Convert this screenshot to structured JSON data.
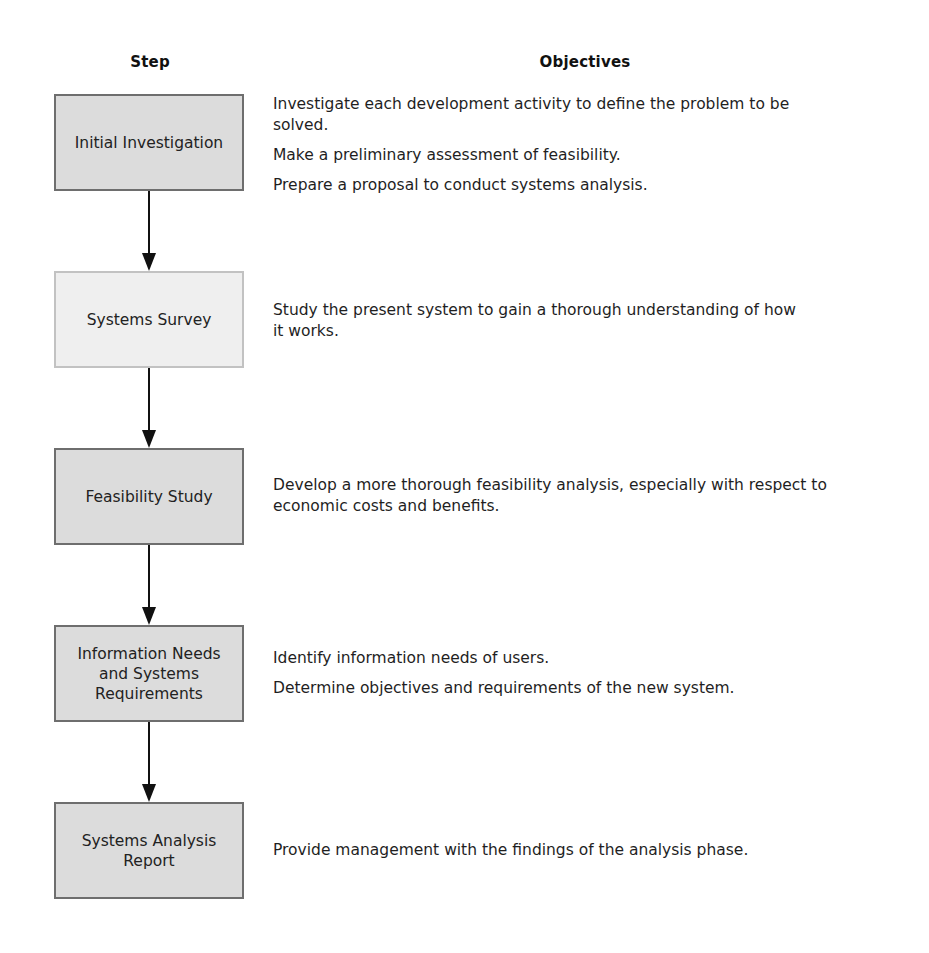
{
  "headers": {
    "step": "Step",
    "objectives": "Objectives"
  },
  "steps": [
    {
      "label": "Initial Investigation",
      "objectives": [
        "Investigate each development activity to define the problem to be solved.",
        "Make a preliminary assessment of feasibility.",
        "Prepare a proposal to conduct systems analysis."
      ]
    },
    {
      "label": "Systems Survey",
      "objectives": [
        "Study the present system to gain a thorough understanding of how it works."
      ]
    },
    {
      "label": "Feasibility Study",
      "objectives": [
        "Develop a more thorough feasibility analysis, especially with respect to economic costs and benefits."
      ]
    },
    {
      "label": "Information Needs and Systems Requirements",
      "objectives": [
        "Identify information needs of users.",
        "Determine objectives and requirements of the new system."
      ]
    },
    {
      "label": "Systems Analysis Report",
      "objectives": [
        "Provide management with the findings of the analysis phase."
      ]
    }
  ],
  "colors": {
    "box_fill": "#dcdcdc",
    "box_border": "#6e6e6e",
    "box_fill_light": "#efefef",
    "box_border_light": "#c2c2c2",
    "arrow": "#111111"
  }
}
